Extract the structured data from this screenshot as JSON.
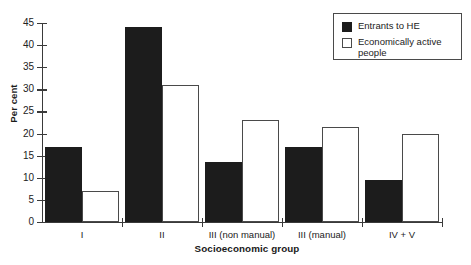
{
  "chart_data": {
    "type": "bar",
    "title": "",
    "xlabel": "Socioeconomic group",
    "ylabel": "Per cent",
    "categories": [
      "I",
      "II",
      "III (non manual)",
      "III (manual)",
      "IV + V"
    ],
    "series": [
      {
        "name": "Entrants to HE",
        "color": "#1c1c1c",
        "values": [
          17,
          44,
          13.5,
          17,
          9.5
        ]
      },
      {
        "name": "Economically active people",
        "color": "#ffffff",
        "values": [
          7,
          31,
          23,
          21.5,
          20
        ]
      }
    ],
    "ylim": [
      0,
      45
    ],
    "yticks": [
      0,
      5,
      10,
      15,
      20,
      25,
      30,
      35,
      40,
      45
    ],
    "ytick_labels": [
      "0",
      "5",
      "10",
      "15",
      "20",
      "25",
      "30",
      "35",
      "40",
      "45"
    ],
    "grid": false,
    "legend_position": "top-right"
  },
  "legend": {
    "entries": [
      {
        "label": "Entrants to HE",
        "swatch": "filled-black"
      },
      {
        "label": "Economically active\npeople",
        "swatch": "outlined-white"
      }
    ]
  }
}
